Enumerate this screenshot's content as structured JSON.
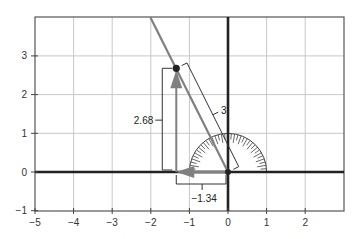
{
  "chart_data": {
    "type": "diagram",
    "title": "",
    "xlabel": "",
    "ylabel": "",
    "xlim": [
      -5,
      3
    ],
    "ylim": [
      -1,
      4
    ],
    "grid": true,
    "x_ticks": [
      -5,
      -4,
      -3,
      -2,
      -1,
      0,
      1,
      2
    ],
    "x_tick_labels": [
      "−5",
      "−4",
      "−3",
      "−2",
      "−1",
      "0",
      "1",
      "2"
    ],
    "y_ticks": [
      -1,
      0,
      1,
      2,
      3
    ],
    "y_tick_labels": [
      "−1",
      "0",
      "1",
      "2",
      "3"
    ],
    "point": {
      "x": -1.34,
      "y": 2.68
    },
    "line": {
      "from": [
        0,
        0
      ],
      "direction_through": [
        -1.34,
        2.68
      ],
      "extends_to_top": true
    },
    "radius_label": "3",
    "x_component_label": "−1.34",
    "y_component_label": "2.68",
    "protractor": {
      "center": [
        0,
        0
      ],
      "radius": 1,
      "half": "upper"
    },
    "colors": {
      "axis": "#222222",
      "grid": "#c8c8c8",
      "line": "#808080",
      "arrow": "#808080",
      "point": "#222222",
      "bracket": "#333333"
    }
  }
}
